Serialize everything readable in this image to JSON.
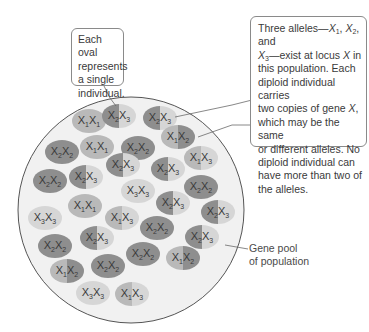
{
  "callouts": {
    "oval_note": {
      "lines": [
        "Each oval",
        "represents",
        "a single",
        "individual."
      ]
    },
    "alleles_note": {
      "segments": [
        {
          "t": "Three alleles—"
        },
        {
          "i": "X",
          "s": "1"
        },
        {
          "t": ", "
        },
        {
          "i": "X",
          "s": "2"
        },
        {
          "t": ", and "
        },
        {
          "br": true
        },
        {
          "i": "X",
          "s": "3"
        },
        {
          "t": "—exist at locus "
        },
        {
          "i": "X",
          "s": ""
        },
        {
          "t": " in"
        },
        {
          "br": true
        },
        {
          "t": "this population. Each"
        },
        {
          "br": true
        },
        {
          "t": "diploid individual carries"
        },
        {
          "br": true
        },
        {
          "t": "two copies of gene "
        },
        {
          "i": "X",
          "s": ""
        },
        {
          "t": ","
        },
        {
          "br": true
        },
        {
          "t": "which may be the same"
        },
        {
          "br": true
        },
        {
          "t": "or different alleles. No"
        },
        {
          "br": true
        },
        {
          "t": "diploid individual can"
        },
        {
          "br": true
        },
        {
          "t": "have more than two of"
        },
        {
          "br": true
        },
        {
          "t": "the alleles."
        }
      ]
    }
  },
  "gene_pool_label": {
    "line1": "Gene pool",
    "line2": "of population"
  },
  "colors": {
    "pool_fill": "#f1f1f1",
    "pool_stroke": "#555555",
    "allele_1": "#b9b9b9",
    "allele_2": "#8e8e8e",
    "allele_3": "#d6d6d6",
    "leader_line": "#6a6a6a"
  },
  "alleles": [
    "X1",
    "X2",
    "X3"
  ],
  "individuals": [
    {
      "genotype": [
        1,
        1
      ]
    },
    {
      "genotype": [
        2,
        3
      ]
    },
    {
      "genotype": [
        2,
        3
      ]
    },
    {
      "genotype": [
        2,
        2
      ]
    },
    {
      "genotype": [
        1,
        1
      ]
    },
    {
      "genotype": [
        2,
        2
      ]
    },
    {
      "genotype": [
        1,
        2
      ]
    },
    {
      "genotype": [
        2,
        3
      ]
    },
    {
      "genotype": [
        2,
        3
      ]
    },
    {
      "genotype": [
        1,
        3
      ]
    },
    {
      "genotype": [
        2,
        2
      ]
    },
    {
      "genotype": [
        2,
        3
      ]
    },
    {
      "genotype": [
        1,
        1
      ]
    },
    {
      "genotype": [
        3,
        3
      ]
    },
    {
      "genotype": [
        2,
        3
      ]
    },
    {
      "genotype": [
        3,
        3
      ]
    },
    {
      "genotype": [
        1,
        3
      ]
    },
    {
      "genotype": [
        2,
        2
      ]
    },
    {
      "genotype": [
        2,
        3
      ]
    },
    {
      "genotype": [
        2,
        3
      ]
    },
    {
      "genotype": [
        2,
        2
      ]
    },
    {
      "genotype": [
        2,
        2
      ]
    },
    {
      "genotype": [
        1,
        2
      ]
    },
    {
      "genotype": [
        1,
        2
      ]
    },
    {
      "genotype": [
        2,
        2
      ]
    },
    {
      "genotype": [
        3,
        3
      ]
    },
    {
      "genotype": [
        1,
        3
      ]
    },
    {
      "genotype": [
        2,
        2
      ]
    },
    {
      "genotype": [
        2,
        3
      ]
    }
  ]
}
